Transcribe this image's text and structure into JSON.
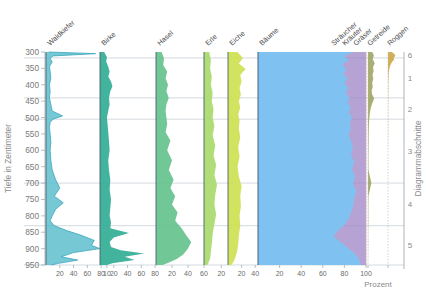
{
  "axes": {
    "depth_axis_title": "Tiefe in Zentimeter",
    "depth_ticks": [
      300,
      350,
      400,
      450,
      500,
      550,
      600,
      650,
      700,
      750,
      800,
      850,
      900,
      950
    ],
    "percent_label": "Prozent",
    "sections_title": "Diagrammabschnitte",
    "section_numbers": [
      "6",
      "5",
      "4",
      "3",
      "2",
      "1"
    ]
  },
  "colors": {
    "waldkiefer": "#4fb8c9",
    "waldkiefer_line": "#3aa5bb",
    "birke": "#2eab92",
    "hasel": "#63c18b",
    "erle": "#a8d96a",
    "eiche": "#cde04f",
    "baeume": "#7cc4f2",
    "straucher_krauter_graser": "#9a7fc4",
    "getreide": "#9aa05a",
    "roggen": "#caa23c",
    "grid": "#b9c3cc",
    "frame": "#4a6070"
  },
  "chart_data": {
    "type": "area",
    "ylabel": "Tiefe in Zentimeter",
    "xlabel": "Prozent",
    "ylim": [
      300,
      950
    ],
    "grid": true,
    "legend": "none",
    "section_boundaries_depth": [
      318,
      440,
      505,
      700,
      830,
      950
    ],
    "curves": [
      {
        "name": "Waldkiefer",
        "label": "Waldkiefer",
        "color": "#4fb8c9",
        "style": "line-with-fill",
        "xticks": [
          20,
          40,
          60,
          80
        ],
        "xlim": [
          0,
          90
        ],
        "depths": [
          300,
          305,
          312,
          320,
          330,
          345,
          360,
          380,
          400,
          420,
          440,
          460,
          480,
          495,
          505,
          515,
          530,
          550,
          575,
          600,
          630,
          660,
          690,
          715,
          740,
          760,
          780,
          800,
          815,
          830,
          845,
          860,
          875,
          890,
          900,
          912,
          925,
          935,
          945,
          950
        ],
        "values": [
          4,
          72,
          10,
          6,
          9,
          5,
          6,
          7,
          5,
          6,
          5,
          7,
          9,
          24,
          10,
          6,
          5,
          6,
          7,
          6,
          7,
          9,
          14,
          20,
          12,
          25,
          14,
          9,
          6,
          12,
          30,
          52,
          70,
          66,
          78,
          40,
          22,
          46,
          18,
          8
        ]
      },
      {
        "name": "Birke",
        "label": "Birke",
        "color": "#2eab92",
        "style": "fill",
        "xticks": [
          10,
          20,
          40,
          60,
          80
        ],
        "xlim": [
          0,
          90
        ],
        "depths": [
          300,
          315,
          330,
          345,
          360,
          375,
          390,
          405,
          420,
          440,
          460,
          480,
          500,
          520,
          545,
          570,
          600,
          630,
          660,
          690,
          720,
          750,
          775,
          800,
          820,
          838,
          852,
          866,
          880,
          895,
          905,
          915,
          925,
          935,
          945,
          950
        ],
        "values": [
          6,
          10,
          9,
          12,
          14,
          12,
          16,
          18,
          15,
          13,
          14,
          12,
          10,
          11,
          12,
          13,
          14,
          12,
          13,
          15,
          14,
          16,
          15,
          14,
          16,
          15,
          42,
          20,
          14,
          16,
          30,
          64,
          36,
          50,
          18,
          10
        ]
      },
      {
        "name": "Hasel",
        "label": "Hasel",
        "color": "#63c18b",
        "style": "fill",
        "xticks": [
          20,
          40,
          60
        ],
        "xlim": [
          0,
          70
        ],
        "depths": [
          300,
          320,
          340,
          360,
          380,
          400,
          420,
          440,
          460,
          480,
          500,
          520,
          545,
          570,
          600,
          630,
          660,
          690,
          715,
          740,
          765,
          790,
          815,
          838,
          860,
          880,
          900,
          918,
          932,
          945,
          950
        ],
        "values": [
          7,
          10,
          9,
          14,
          12,
          15,
          13,
          16,
          13,
          12,
          13,
          14,
          12,
          18,
          14,
          20,
          16,
          22,
          18,
          24,
          20,
          27,
          24,
          32,
          38,
          44,
          40,
          34,
          26,
          14,
          8
        ]
      },
      {
        "name": "Erle",
        "label": "Erle",
        "color": "#a8d96a",
        "style": "fill",
        "xticks": [
          20
        ],
        "xlim": [
          0,
          30
        ],
        "depths": [
          300,
          325,
          350,
          375,
          400,
          425,
          450,
          475,
          500,
          525,
          555,
          585,
          615,
          645,
          675,
          705,
          735,
          765,
          795,
          825,
          855,
          885,
          910,
          930,
          945,
          950
        ],
        "values": [
          6,
          8,
          7,
          9,
          8,
          10,
          9,
          11,
          10,
          12,
          10,
          13,
          11,
          14,
          12,
          15,
          13,
          12,
          14,
          12,
          10,
          9,
          8,
          7,
          5,
          4
        ]
      },
      {
        "name": "Eiche",
        "label": "Eiche",
        "color": "#cde04f",
        "style": "fill",
        "xticks": [
          20,
          40
        ],
        "xlim": [
          0,
          50
        ],
        "depths": [
          300,
          318,
          335,
          352,
          370,
          390,
          410,
          430,
          450,
          470,
          490,
          510,
          535,
          560,
          590,
          620,
          650,
          680,
          710,
          740,
          770,
          800,
          830,
          860,
          888,
          912,
          932,
          945,
          950
        ],
        "values": [
          14,
          22,
          16,
          26,
          18,
          20,
          17,
          19,
          16,
          18,
          15,
          17,
          16,
          18,
          15,
          17,
          14,
          16,
          20,
          18,
          19,
          17,
          18,
          16,
          15,
          13,
          10,
          7,
          5
        ]
      },
      {
        "name": "Bäume",
        "label": "Bäume",
        "color": "#7cc4f2",
        "style": "stacked-fill",
        "xticks": [
          20,
          40,
          60,
          80,
          100
        ],
        "xlim": [
          0,
          100
        ],
        "depths": [
          300,
          312,
          325,
          338,
          352,
          366,
          380,
          395,
          410,
          425,
          440,
          455,
          470,
          485,
          500,
          515,
          532,
          550,
          570,
          590,
          612,
          635,
          658,
          680,
          702,
          725,
          748,
          770,
          790,
          810,
          828,
          845,
          862,
          878,
          895,
          910,
          925,
          938,
          948,
          950
        ],
        "values": [
          88,
          80,
          84,
          78,
          82,
          79,
          83,
          80,
          84,
          81,
          85,
          83,
          86,
          84,
          87,
          85,
          86,
          84,
          86,
          88,
          86,
          89,
          87,
          90,
          88,
          91,
          89,
          88,
          86,
          84,
          80,
          74,
          70,
          76,
          82,
          88,
          92,
          94,
          95,
          96
        ]
      },
      {
        "name": "Sträucher Kräuter Gräser",
        "label": [
          "Sträucher",
          "Kräuter",
          "Gräser"
        ],
        "color": "#9a7fc4",
        "style": "stacked-fill-top",
        "xlim": [
          0,
          100
        ],
        "depths": [
          300,
          312,
          325,
          338,
          352,
          366,
          380,
          395,
          410,
          425,
          440,
          455,
          470,
          485,
          500,
          515,
          532,
          550,
          570,
          590,
          612,
          635,
          658,
          680,
          702,
          725,
          748,
          770,
          790,
          810,
          828,
          845,
          862,
          878,
          895,
          910,
          925,
          938,
          948,
          950
        ],
        "values": [
          12,
          20,
          16,
          22,
          18,
          21,
          17,
          20,
          16,
          19,
          15,
          17,
          14,
          16,
          13,
          15,
          14,
          16,
          14,
          12,
          14,
          11,
          13,
          10,
          12,
          9,
          11,
          12,
          14,
          16,
          20,
          26,
          30,
          24,
          18,
          12,
          8,
          6,
          5,
          4
        ]
      },
      {
        "name": "Getreide",
        "label": "Getreide",
        "color": "#9aa05a",
        "style": "fill",
        "xlim": [
          0,
          10
        ],
        "depths": [
          300,
          310,
          322,
          334,
          346,
          358,
          370,
          382,
          394,
          406,
          418,
          430,
          442,
          455,
          470,
          490,
          510,
          540,
          580,
          620,
          660,
          700,
          740,
          780,
          820,
          860,
          900,
          950
        ],
        "values": [
          3.0,
          4.2,
          3.4,
          4.8,
          3.6,
          4.0,
          3.2,
          3.8,
          3.0,
          3.4,
          2.6,
          3.0,
          4.4,
          3.2,
          2.0,
          1.2,
          0.8,
          0.5,
          0.4,
          0.3,
          0.3,
          2.4,
          0.3,
          0.2,
          0.2,
          0.1,
          0.1,
          0.0
        ]
      },
      {
        "name": "Roggen",
        "label": "Roggen",
        "color": "#caa23c",
        "style": "fill",
        "xlim": [
          0,
          10
        ],
        "depths": [
          300,
          306,
          312,
          318,
          324,
          330,
          336,
          342,
          350,
          360,
          372,
          386,
          400,
          420,
          450,
          490,
          540,
          600,
          660,
          720,
          780,
          840,
          900,
          950
        ],
        "values": [
          2.6,
          4.6,
          5.2,
          4.0,
          4.4,
          3.0,
          2.2,
          1.6,
          1.0,
          0.6,
          0.4,
          0.3,
          0.2,
          0.2,
          0.1,
          0.1,
          0.1,
          0.0,
          0.0,
          0.0,
          0.0,
          0.0,
          0.0,
          0.0
        ]
      }
    ]
  }
}
